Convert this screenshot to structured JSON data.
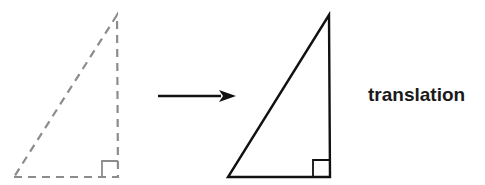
{
  "diagram": {
    "title": "translation",
    "label": "translation",
    "colors": {
      "background": "#ffffff",
      "original_stroke": "#8c8c8c",
      "image_stroke": "#111111",
      "arrow": "#111111",
      "text": "#1a1a1a"
    },
    "original_triangle": {
      "style": "dashed",
      "vertices": [
        [
          14,
          177
        ],
        [
          118,
          177
        ],
        [
          117,
          15
        ]
      ],
      "right_angle_marker": {
        "x": 102,
        "y": 161,
        "size": 16
      }
    },
    "arrow": {
      "from": [
        158,
        96
      ],
      "to": [
        236,
        96
      ],
      "direction": "right"
    },
    "translated_triangle": {
      "style": "solid",
      "vertices": [
        [
          228,
          177
        ],
        [
          330,
          177
        ],
        [
          329,
          15
        ]
      ],
      "right_angle_marker": {
        "x": 313,
        "y": 160,
        "size": 17
      }
    }
  }
}
